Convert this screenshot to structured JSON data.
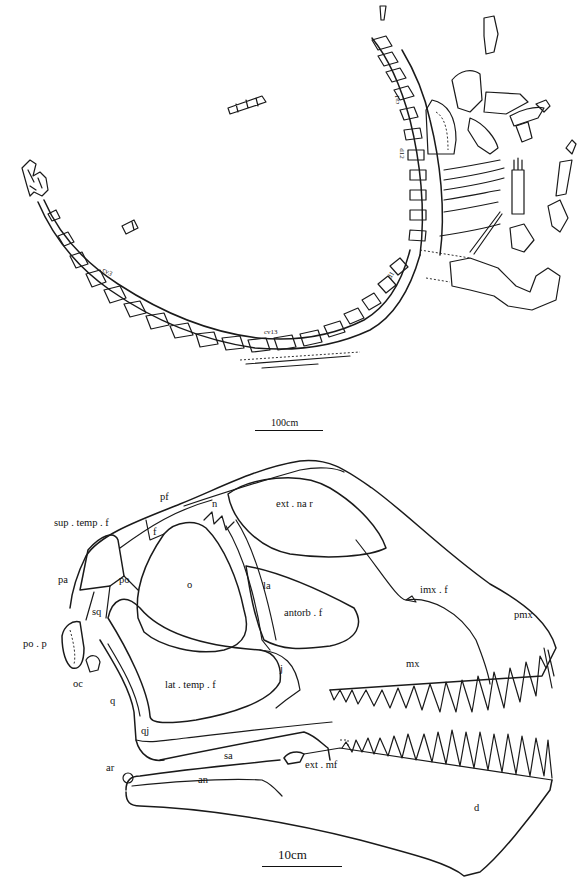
{
  "figure": {
    "panel_skeleton": {
      "description": "Quarry map of articulated sauropod skeleton",
      "vertebra_labels": [
        {
          "id": "ca1",
          "text": "ca1"
        },
        {
          "id": "d12",
          "text": "d12"
        },
        {
          "id": "d1",
          "text": "d1"
        },
        {
          "id": "cv13",
          "text": "cv13"
        },
        {
          "id": "cv3",
          "text": "cv3"
        }
      ],
      "scale_bar": {
        "label": "100cm"
      }
    },
    "panel_skull": {
      "description": "Skull in lateral view with anatomical labels",
      "labels": [
        {
          "id": "sup_temp_f",
          "text": "sup . temp . f"
        },
        {
          "id": "pf",
          "text": "pf"
        },
        {
          "id": "n",
          "text": "n"
        },
        {
          "id": "f",
          "text": "f"
        },
        {
          "id": "ext_nar",
          "text": "ext . na r"
        },
        {
          "id": "pa",
          "text": "pa"
        },
        {
          "id": "po",
          "text": "po"
        },
        {
          "id": "o",
          "text": "o"
        },
        {
          "id": "la",
          "text": "la"
        },
        {
          "id": "imx_f",
          "text": "imx . f"
        },
        {
          "id": "antorb_f",
          "text": "antorb . f"
        },
        {
          "id": "pmx",
          "text": "pmx"
        },
        {
          "id": "sq",
          "text": "sq"
        },
        {
          "id": "po_p",
          "text": "po . p"
        },
        {
          "id": "mx",
          "text": "mx"
        },
        {
          "id": "oc",
          "text": "oc"
        },
        {
          "id": "lat_temp_f",
          "text": "lat . temp . f"
        },
        {
          "id": "j",
          "text": "j"
        },
        {
          "id": "q",
          "text": "q"
        },
        {
          "id": "qj",
          "text": "qj"
        },
        {
          "id": "sa",
          "text": "sa"
        },
        {
          "id": "ar",
          "text": "ar"
        },
        {
          "id": "ext_mf",
          "text": "ext . mf"
        },
        {
          "id": "an",
          "text": "an"
        },
        {
          "id": "d",
          "text": "d"
        }
      ],
      "scale_bar": {
        "label": "10cm"
      }
    }
  }
}
